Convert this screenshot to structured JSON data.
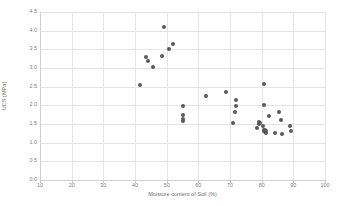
{
  "chart_data": {
    "type": "scatter",
    "title": "",
    "xlabel": "Moisture content of Soil (%)",
    "ylabel": "UCS (MPa)",
    "xlim": [
      10,
      100
    ],
    "ylim": [
      0.0,
      4.5
    ],
    "xticks": [
      "10",
      "20",
      "30",
      "40",
      "50",
      "60",
      "70",
      "80",
      "90",
      "100"
    ],
    "yticks": [
      "0.0",
      "0.5",
      "1.0",
      "1.5",
      "2.0",
      "2.5",
      "3.0",
      "3.5",
      "4.0",
      "4.5"
    ],
    "xtick_values": [
      10,
      20,
      30,
      40,
      50,
      60,
      70,
      80,
      90,
      100
    ],
    "ytick_values": [
      0.0,
      0.5,
      1.0,
      1.5,
      2.0,
      2.5,
      3.0,
      3.5,
      4.0,
      4.5
    ],
    "grid": true,
    "legend": false,
    "marker_color": "#595959",
    "grid_color": "#e4e4e4",
    "axis_color": "#d0d0d0",
    "tick_text_color": "#808080",
    "axis_title_color": "#6f6f6f",
    "series": [
      {
        "name": "UCS vs Moisture content",
        "points": [
          [
            41.5,
            2.55
          ],
          [
            43.5,
            3.3
          ],
          [
            44.2,
            3.19
          ],
          [
            45.8,
            3.04
          ],
          [
            48.6,
            3.31
          ],
          [
            49.3,
            4.11
          ],
          [
            50.8,
            3.52
          ],
          [
            52.0,
            3.65
          ],
          [
            55.0,
            1.97
          ],
          [
            55.0,
            1.75
          ],
          [
            55.2,
            1.63
          ],
          [
            55.3,
            1.59
          ],
          [
            62.5,
            2.24
          ],
          [
            68.8,
            2.37
          ],
          [
            71.0,
            1.52
          ],
          [
            71.6,
            1.82
          ],
          [
            71.8,
            1.98
          ],
          [
            71.9,
            2.13
          ],
          [
            78.6,
            1.39
          ],
          [
            79.0,
            1.49
          ],
          [
            79.3,
            1.55
          ],
          [
            79.5,
            1.53
          ],
          [
            80.4,
            1.44
          ],
          [
            80.6,
            1.34
          ],
          [
            80.8,
            1.3
          ],
          [
            81.0,
            1.28
          ],
          [
            81.1,
            1.33
          ],
          [
            81.3,
            1.26
          ],
          [
            81.4,
            1.31
          ],
          [
            80.8,
            2.02
          ],
          [
            80.6,
            2.58
          ],
          [
            82.3,
            1.71
          ],
          [
            84.2,
            1.27
          ],
          [
            85.6,
            1.82
          ],
          [
            86.0,
            1.62
          ],
          [
            86.4,
            1.24
          ],
          [
            88.8,
            1.44
          ],
          [
            89.4,
            1.3
          ]
        ]
      }
    ]
  }
}
